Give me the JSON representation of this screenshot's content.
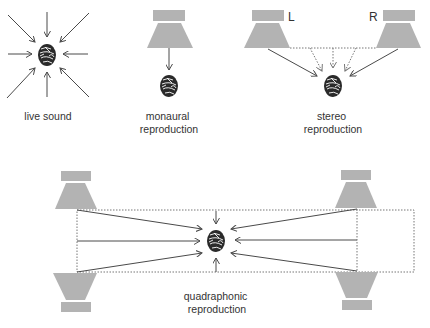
{
  "diagram": {
    "panels": [
      {
        "id": "live",
        "label_lines": [
          "live sound"
        ],
        "speakers": 0,
        "description": "8 arrows converging on listener from all directions"
      },
      {
        "id": "mono",
        "label_lines": [
          "monaural",
          "reproduction"
        ],
        "speakers": 1,
        "description": "single speaker above listener, one arrow down"
      },
      {
        "id": "stereo",
        "label_lines": [
          "stereo",
          "reproduction"
        ],
        "speakers": 2,
        "speaker_labels": [
          "L",
          "R"
        ],
        "description": "two speakers, solid arrows from speakers and dotted phantom arrows from between them"
      },
      {
        "id": "quad",
        "label_lines": [
          "quadraphonic",
          "reproduction"
        ],
        "speakers": 4,
        "description": "four corner speakers, dotted rectangle, arrows from left and right sides plus top and bottom"
      }
    ],
    "colors": {
      "speaker": "#b3b3b3",
      "line": "#4a4a4a",
      "dotted": "#777777",
      "head": "#2a2a2a",
      "text": "#333333"
    }
  }
}
